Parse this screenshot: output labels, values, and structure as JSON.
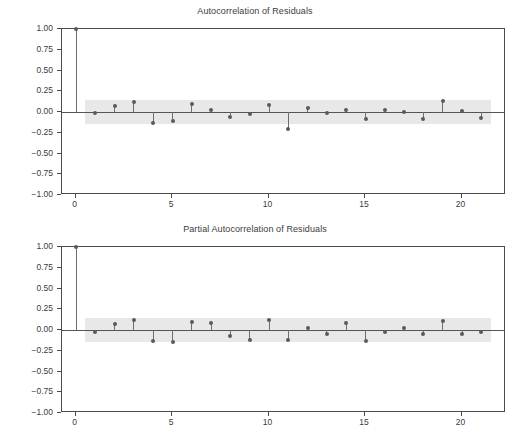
{
  "figure": {
    "width": 510,
    "height": 435,
    "background": "#ffffff",
    "marker_color": "#5a5a5a",
    "stem_color": "#6e6e6e",
    "band_color": "#e8e8e8",
    "axis_color": "#4a4a4a",
    "text_color": "#3b3b3b"
  },
  "chart_data": [
    {
      "type": "line",
      "subtype": "stem-correlogram",
      "title": "Autocorrelation of Residuals",
      "xlabel": "",
      "ylabel": "",
      "xlim": [
        -0.7,
        22.3
      ],
      "ylim": [
        -1.0,
        1.0
      ],
      "grid": false,
      "legend": "none",
      "yticks": [
        1.0,
        0.75,
        0.5,
        0.25,
        0.0,
        -0.25,
        -0.5,
        -0.75,
        -1.0
      ],
      "ytick_labels": [
        "1.00",
        "0.75",
        "0.50",
        "0.25",
        "0.00",
        "-0.25",
        "-0.50",
        "-0.75",
        "-1.00"
      ],
      "xticks": [
        0,
        5,
        10,
        15,
        20
      ],
      "xtick_labels": [
        "0",
        "5",
        "10",
        "15",
        "20"
      ],
      "confidence_band": {
        "label": "95% confidence interval",
        "upper": 0.145,
        "lower": -0.145,
        "x_start": 0.5,
        "x_end": 21.5
      },
      "x": [
        0,
        1,
        2,
        3,
        4,
        5,
        6,
        7,
        8,
        9,
        10,
        11,
        12,
        13,
        14,
        15,
        16,
        17,
        18,
        19,
        20,
        21
      ],
      "values": [
        1.0,
        -0.01,
        0.07,
        0.12,
        -0.13,
        -0.11,
        0.1,
        0.03,
        -0.06,
        -0.03,
        0.09,
        -0.2,
        0.05,
        -0.01,
        0.02,
        -0.09,
        0.02,
        0.0,
        -0.09,
        0.13,
        0.01,
        -0.07
      ]
    },
    {
      "type": "line",
      "subtype": "stem-correlogram",
      "title": "Partial Autocorrelation of Residuals",
      "xlabel": "",
      "ylabel": "",
      "xlim": [
        -0.7,
        22.3
      ],
      "ylim": [
        -1.0,
        1.0
      ],
      "grid": false,
      "legend": "none",
      "yticks": [
        1.0,
        0.75,
        0.5,
        0.25,
        0.0,
        -0.25,
        -0.5,
        -0.75,
        -1.0
      ],
      "ytick_labels": [
        "1.00",
        "0.75",
        "0.50",
        "0.25",
        "0.00",
        "-0.25",
        "-0.50",
        "-0.75",
        "-1.00"
      ],
      "xticks": [
        0,
        5,
        10,
        15,
        20
      ],
      "xtick_labels": [
        "0",
        "5",
        "10",
        "15",
        "20"
      ],
      "confidence_band": {
        "label": "95% confidence interval",
        "upper": 0.145,
        "lower": -0.145,
        "x_start": 0.5,
        "x_end": 21.5
      },
      "x": [
        0,
        1,
        2,
        3,
        4,
        5,
        6,
        7,
        8,
        9,
        10,
        11,
        12,
        13,
        14,
        15,
        16,
        17,
        18,
        19,
        20,
        21
      ],
      "values": [
        1.0,
        -0.02,
        0.07,
        0.12,
        -0.13,
        -0.14,
        0.1,
        0.09,
        -0.07,
        -0.12,
        0.12,
        -0.12,
        0.02,
        -0.05,
        0.09,
        -0.13,
        -0.03,
        0.02,
        -0.05,
        0.11,
        -0.05,
        -0.03
      ]
    }
  ]
}
